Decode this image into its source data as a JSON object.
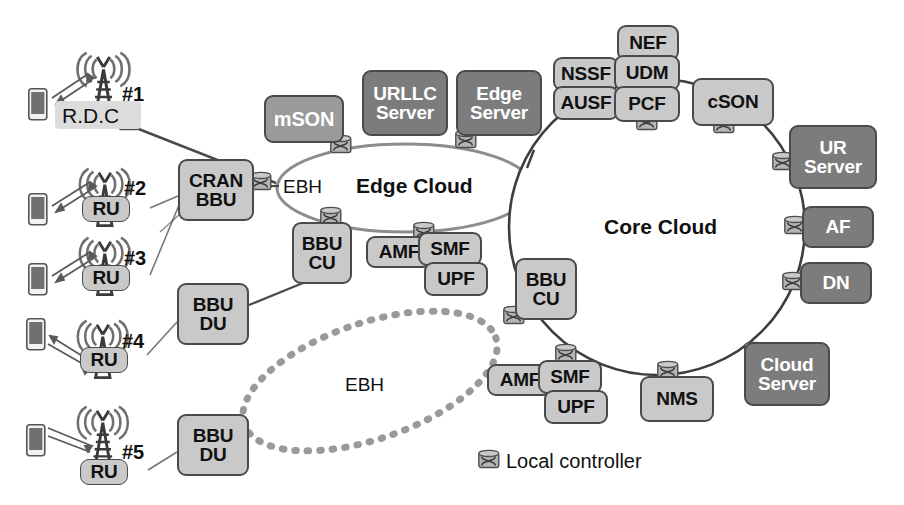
{
  "diagram": {
    "clouds": [
      {
        "id": "edge-cloud",
        "label": "Edge Cloud",
        "shape": "ellipse",
        "cx": 405,
        "cy": 188,
        "rx": 128,
        "ry": 44
      },
      {
        "id": "core-cloud",
        "label": "Core Cloud",
        "shape": "circle",
        "cx": 657,
        "cy": 227,
        "rx": 148,
        "ry": 148
      }
    ],
    "link_labels": [
      {
        "id": "ebh-edge",
        "text": "EBH",
        "x": 283,
        "y": 178
      },
      {
        "id": "ebh-dotted",
        "text": "EBH",
        "x": 357,
        "y": 380
      }
    ],
    "access_sites": [
      {
        "id": "site-1",
        "tag": "#1",
        "ru_label": "R.D.C",
        "highlighted": true
      },
      {
        "id": "site-2",
        "tag": "#2",
        "ru_label": "RU",
        "highlighted": false
      },
      {
        "id": "site-3",
        "tag": "#3",
        "ru_label": "RU",
        "highlighted": false
      },
      {
        "id": "site-4",
        "tag": "#4",
        "ru_label": "RU",
        "highlighted": false
      },
      {
        "id": "site-5",
        "tag": "#5",
        "ru_label": "RU",
        "highlighted": false
      }
    ],
    "nodes": [
      {
        "id": "cran-bbu",
        "lines": [
          "CRAN",
          "BBU"
        ],
        "tone": "lt",
        "x": 178,
        "y": 159,
        "w": 76,
        "h": 62,
        "fs": 19
      },
      {
        "id": "bbu-du-1",
        "lines": [
          "BBU",
          "DU"
        ],
        "tone": "lt",
        "x": 177,
        "y": 283,
        "w": 72,
        "h": 62,
        "fs": 19
      },
      {
        "id": "bbu-du-2",
        "lines": [
          "BBU",
          "DU"
        ],
        "tone": "lt",
        "x": 177,
        "y": 414,
        "w": 72,
        "h": 62,
        "fs": 19
      },
      {
        "id": "mson",
        "lines": [
          "mSON"
        ],
        "tone": "md",
        "x": 264,
        "y": 95,
        "w": 80,
        "h": 48,
        "fs": 20
      },
      {
        "id": "urllc-server",
        "lines": [
          "URLLC",
          "Server"
        ],
        "tone": "dk",
        "x": 362,
        "y": 70,
        "w": 86,
        "h": 66,
        "fs": 19
      },
      {
        "id": "edge-server",
        "lines": [
          "Edge",
          "Server"
        ],
        "tone": "dk",
        "x": 456,
        "y": 70,
        "w": 86,
        "h": 66,
        "fs": 19
      },
      {
        "id": "bbu-cu-1",
        "lines": [
          "BBU",
          "CU"
        ],
        "tone": "lt",
        "x": 292,
        "y": 222,
        "w": 60,
        "h": 62,
        "fs": 19
      },
      {
        "id": "amf-1",
        "lines": [
          "AMF"
        ],
        "tone": "lt",
        "x": 366,
        "y": 236,
        "w": 66,
        "h": 32,
        "fs": 19
      },
      {
        "id": "smf-1",
        "lines": [
          "SMF"
        ],
        "tone": "lt",
        "x": 418,
        "y": 232,
        "w": 64,
        "h": 34,
        "fs": 19
      },
      {
        "id": "upf-1",
        "lines": [
          "UPF"
        ],
        "tone": "lt",
        "x": 424,
        "y": 262,
        "w": 64,
        "h": 34,
        "fs": 19
      },
      {
        "id": "nef",
        "lines": [
          "NEF"
        ],
        "tone": "lt",
        "x": 617,
        "y": 25,
        "w": 62,
        "h": 36,
        "fs": 19
      },
      {
        "id": "nssf",
        "lines": [
          "NSSF"
        ],
        "tone": "lt",
        "x": 553,
        "y": 57,
        "w": 66,
        "h": 34,
        "fs": 19
      },
      {
        "id": "udm",
        "lines": [
          "UDM"
        ],
        "tone": "lt",
        "x": 614,
        "y": 55,
        "w": 66,
        "h": 36,
        "fs": 19
      },
      {
        "id": "ausf",
        "lines": [
          "AUSF"
        ],
        "tone": "lt",
        "x": 553,
        "y": 86,
        "w": 66,
        "h": 34,
        "fs": 19
      },
      {
        "id": "pcf",
        "lines": [
          "PCF"
        ],
        "tone": "lt",
        "x": 614,
        "y": 86,
        "w": 66,
        "h": 36,
        "fs": 19
      },
      {
        "id": "cson",
        "lines": [
          "cSON"
        ],
        "tone": "lt",
        "x": 692,
        "y": 78,
        "w": 82,
        "h": 48,
        "fs": 19
      },
      {
        "id": "ur-server",
        "lines": [
          "UR",
          "Server"
        ],
        "tone": "dk",
        "x": 789,
        "y": 125,
        "w": 88,
        "h": 64,
        "fs": 19
      },
      {
        "id": "af",
        "lines": [
          "AF"
        ],
        "tone": "dk",
        "x": 802,
        "y": 206,
        "w": 72,
        "h": 42,
        "fs": 19
      },
      {
        "id": "dn",
        "lines": [
          "DN"
        ],
        "tone": "dk",
        "x": 800,
        "y": 262,
        "w": 72,
        "h": 42,
        "fs": 19
      },
      {
        "id": "cloud-server",
        "lines": [
          "Cloud",
          "Server"
        ],
        "tone": "dk",
        "x": 744,
        "y": 342,
        "w": 86,
        "h": 64,
        "fs": 19
      },
      {
        "id": "bbu-cu-2",
        "lines": [
          "BBU",
          "CU"
        ],
        "tone": "lt",
        "x": 515,
        "y": 258,
        "w": 62,
        "h": 62,
        "fs": 19
      },
      {
        "id": "amf-2",
        "lines": [
          "AMF"
        ],
        "tone": "lt",
        "x": 487,
        "y": 364,
        "w": 66,
        "h": 32,
        "fs": 19
      },
      {
        "id": "smf-2",
        "lines": [
          "SMF"
        ],
        "tone": "lt",
        "x": 538,
        "y": 360,
        "w": 64,
        "h": 34,
        "fs": 19
      },
      {
        "id": "upf-2",
        "lines": [
          "UPF"
        ],
        "tone": "lt",
        "x": 544,
        "y": 390,
        "w": 64,
        "h": 34,
        "fs": 19
      },
      {
        "id": "nms",
        "lines": [
          "NMS"
        ],
        "tone": "lt",
        "x": 640,
        "y": 376,
        "w": 74,
        "h": 46,
        "fs": 19
      }
    ],
    "legend": {
      "icon": "router-icon",
      "text": "Local controller",
      "x": 477,
      "y": 455
    }
  }
}
